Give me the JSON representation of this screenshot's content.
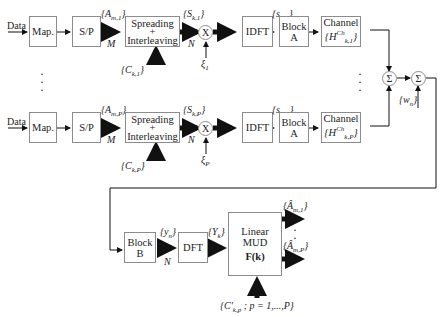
{
  "transmitters": [
    {
      "input_label": "Data",
      "map_label": "Map.",
      "sp_label": "S/P",
      "symbols_label": "{A_m,1}",
      "m_label": "M",
      "spreading_line1": "Spreading",
      "spreading_plus": "+",
      "spreading_line2": "Interleaving",
      "code_label": "{C_k,1}",
      "chips_label": "{S_k,1}",
      "n_label": "N",
      "multiplier": "X",
      "xi_label": "ξ_1",
      "idft_label": "IDFT",
      "time_label": "{s_n,1}",
      "block_a_line1": "Block",
      "block_a_line2": "A",
      "channel_line1": "Channel",
      "channel_line2": "{H_k,1^Ch}"
    },
    {
      "input_label": "Data",
      "map_label": "Map.",
      "sp_label": "S/P",
      "symbols_label": "{A_m,P}",
      "m_label": "M",
      "spreading_line1": "Spreading",
      "spreading_plus": "+",
      "spreading_line2": "Interleaving",
      "code_label": "{C_k,P}",
      "chips_label": "{S_k,P}",
      "n_label": "N",
      "multiplier": "X",
      "xi_label": "ξ_P",
      "idft_label": "IDFT",
      "time_label": "{s_n,P}",
      "block_a_line1": "Block",
      "block_a_line2": "A",
      "channel_line1": "Channel",
      "channel_line2": "{H_k,P^Ch}"
    }
  ],
  "sum1": "Σ",
  "sum2": "Σ",
  "noise_label": "{w_n}",
  "receiver": {
    "block_b_line1": "Block",
    "block_b_line2": "B",
    "rx_time_label": "{y_n}",
    "n_label": "N",
    "dft_label": "DFT",
    "rx_freq_label": "{Y_k}",
    "mud_line1": "Linear",
    "mud_line2": "MUD",
    "mud_line3": "F(k)",
    "codes_label": "{C'_k,p ; p = 1,...,P}",
    "output1_label": "{Â_m,1}",
    "outputP_label": "{Â_m,P}"
  },
  "ellipsis": "⋮"
}
